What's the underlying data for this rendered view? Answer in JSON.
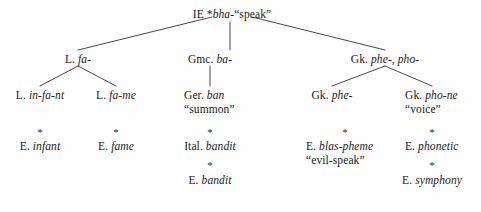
{
  "figure": {
    "type": "etymology-tree",
    "root": {
      "label_prefix": "IE *",
      "label_italic": "bha",
      "label_suffix": "-“speak”",
      "full_text": "IE *bha-“speak”"
    },
    "level2": [
      {
        "prefix": "L. ",
        "italic": "fa-",
        "full_text": "L. fa-"
      },
      {
        "prefix": "Gmc. ",
        "italic": "ba-",
        "full_text": "Gmc. ba-"
      },
      {
        "prefix": "Gk. ",
        "italic": "phe-, pho-",
        "full_text": "Gk. phe-, pho-"
      }
    ],
    "level3": [
      {
        "prefix": "L. ",
        "italic": "in-fa-nt",
        "gloss": "",
        "full_text": "L. in-fa-nt"
      },
      {
        "prefix": "L. ",
        "italic": "fa-me",
        "gloss": "",
        "full_text": "L. fa-me"
      },
      {
        "prefix": "Ger. ",
        "italic": "ban",
        "gloss": "“summon”",
        "full_text": "Ger. ban “summon”"
      },
      {
        "prefix": "Gk. ",
        "italic": "phe-",
        "gloss": "",
        "full_text": "Gk. phe-"
      },
      {
        "prefix": "Gk. ",
        "italic": "pho-ne",
        "gloss": "“voice”",
        "full_text": "Gk. pho-ne “voice”"
      }
    ],
    "level4": [
      {
        "prefix": "E. ",
        "italic": "infant",
        "gloss": "",
        "full_text": "E. infant"
      },
      {
        "prefix": "E. ",
        "italic": "fame",
        "gloss": "",
        "full_text": "E. fame"
      },
      {
        "prefix": "Ital. ",
        "italic": "bandit",
        "gloss": "",
        "full_text": "Ital. bandit"
      },
      {
        "prefix": "E. ",
        "italic": "blas-pheme",
        "gloss": "“evil-speak”",
        "full_text": "E. blas-pheme “evil-speak”"
      },
      {
        "prefix": "E. ",
        "italic": "phonetic",
        "gloss": "",
        "full_text": "E. phonetic"
      }
    ],
    "level5": [
      {
        "prefix": "E. ",
        "italic": "bandit",
        "gloss": "",
        "full_text": "E. bandit"
      },
      {
        "prefix": "E. ",
        "italic": "symphony",
        "gloss": "",
        "full_text": "E. symphony"
      }
    ],
    "derivation_marker": "*",
    "markers": {
      "row4": [
        "*",
        "*",
        "*",
        "*",
        "*"
      ],
      "row5": [
        "*",
        "*"
      ]
    },
    "colors": {
      "background": "#fefefe",
      "text": "#1a1a1a",
      "line": "#33333a"
    }
  }
}
